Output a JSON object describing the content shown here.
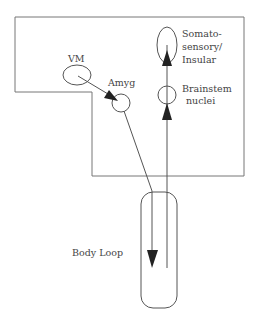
{
  "diagram": {
    "type": "somatic-marker body loop",
    "nodes": {
      "vm": {
        "label": "VM"
      },
      "amyg": {
        "label": "Amyg"
      },
      "somato": {
        "label_lines": [
          "Somato-",
          "sensory/",
          "Insular"
        ]
      },
      "brainstem": {
        "label_lines": [
          "Brainstem",
          "nuclei"
        ]
      },
      "body": {
        "label": "Body Loop"
      }
    },
    "edges": [
      {
        "from": "VM",
        "to": "Amyg"
      },
      {
        "from": "Amyg",
        "to": "Body"
      },
      {
        "from": "Body",
        "to": "Brainstem nuclei"
      },
      {
        "from": "Brainstem nuclei",
        "to": "Somatosensory/Insular"
      }
    ],
    "colors": {
      "line": "#555555",
      "arrow": "#222222",
      "text": "#444444"
    }
  }
}
